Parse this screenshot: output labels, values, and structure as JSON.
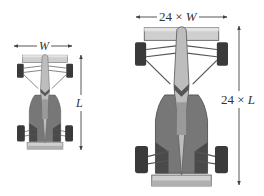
{
  "figure": {
    "colors": {
      "background": "#ffffff",
      "line": "#444444",
      "body_dark": "#4a4a4a",
      "body_mid": "#777777",
      "body_light": "#bdbdbd",
      "wing": "#cfcfcf",
      "tire": "#3a3a3a"
    },
    "small_car": {
      "width_label_var": "W",
      "length_label_var": "L"
    },
    "large_car": {
      "scale_factor": "24",
      "times_symbol": "×",
      "width_label_var": "W",
      "length_label_var": "L"
    }
  }
}
